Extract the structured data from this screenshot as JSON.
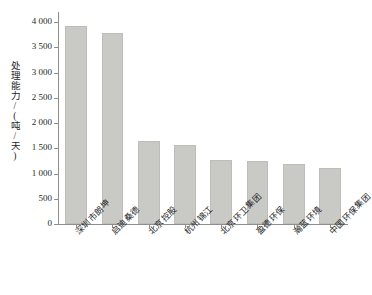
{
  "chart_data": {
    "type": "bar",
    "title": "",
    "xlabel": "",
    "ylabel": "处理能力/(吨/天)",
    "ylim": [
      0,
      4200
    ],
    "ytick_values": [
      0,
      500,
      1000,
      1500,
      2000,
      2500,
      3000,
      3500,
      4000
    ],
    "ytick_labels": [
      "0",
      "500",
      "1 000",
      "1 500",
      "2 000",
      "2 500",
      "3 000",
      "3 500",
      "4 000"
    ],
    "grid": false,
    "legend": null,
    "bar_color": "#c9c9c6",
    "axis_color": "#8e8e8e",
    "categories": [
      "深圳市朗坤",
      "启迪桑德",
      "北京控股",
      "杭州锦江",
      "北京环卫集团",
      "盈德环保",
      "瀚蓝环境",
      "中国环保集团"
    ],
    "values": [
      3930,
      3780,
      1650,
      1560,
      1270,
      1240,
      1180,
      1100
    ]
  }
}
